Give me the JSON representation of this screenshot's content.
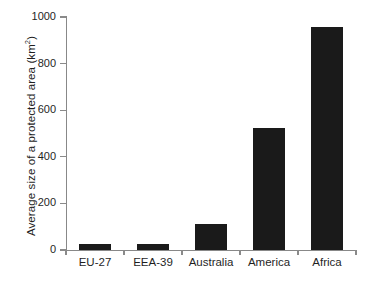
{
  "chart_data": {
    "type": "bar",
    "title": "",
    "subtitle": "",
    "xlabel": "",
    "ylabel": "Average size of a protected area (km2)",
    "ylabel_base": "Average size of a protected area (km",
    "ylabel_sup": "2",
    "ylabel_tail": ")",
    "categories": [
      "EU-27",
      "EEA-39",
      "Australia",
      "America",
      "Africa"
    ],
    "values": [
      25,
      25,
      113,
      522,
      957
    ],
    "ylim": [
      0,
      1000
    ],
    "yticks": [
      0,
      200,
      400,
      600,
      800,
      1000
    ],
    "ytick_labels": [
      "0",
      "200",
      "400",
      "600",
      "800",
      "1000"
    ],
    "grid": false,
    "legend": "none",
    "bar_color": "#1a1a1a",
    "axis_color": "#888888",
    "background_color": "#ffffff"
  }
}
